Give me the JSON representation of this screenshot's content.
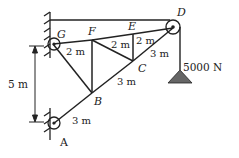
{
  "diagram": {
    "type": "truss with pulley and hanging load",
    "nodes": [
      {
        "id": "A",
        "label": "A",
        "x": 53,
        "y": 124
      },
      {
        "id": "B",
        "label": "B",
        "x": 92,
        "y": 93
      },
      {
        "id": "C",
        "label": "C",
        "x": 133,
        "y": 61
      },
      {
        "id": "D",
        "label": "D",
        "x": 173,
        "y": 28
      },
      {
        "id": "E",
        "label": "E",
        "x": 133,
        "y": 34
      },
      {
        "id": "F",
        "label": "F",
        "x": 92,
        "y": 40
      },
      {
        "id": "G",
        "label": "G",
        "x": 53,
        "y": 44
      }
    ],
    "members": [
      [
        "A",
        "B"
      ],
      [
        "B",
        "C"
      ],
      [
        "C",
        "D"
      ],
      [
        "G",
        "F"
      ],
      [
        "F",
        "E"
      ],
      [
        "E",
        "D"
      ],
      [
        "G",
        "B"
      ],
      [
        "F",
        "B"
      ],
      [
        "F",
        "C"
      ],
      [
        "E",
        "C"
      ]
    ],
    "dimension_labels": {
      "GF": "2 m",
      "FE": "2 m",
      "ED": "2 m",
      "AB": "3 m",
      "BC": "3 m",
      "CD": "3 m",
      "height": "5 m"
    },
    "load": {
      "label": "5000 N",
      "color": "#666666"
    },
    "colors": {
      "line": "#222222",
      "load_fill": "#666666",
      "background": "#ffffff"
    }
  }
}
